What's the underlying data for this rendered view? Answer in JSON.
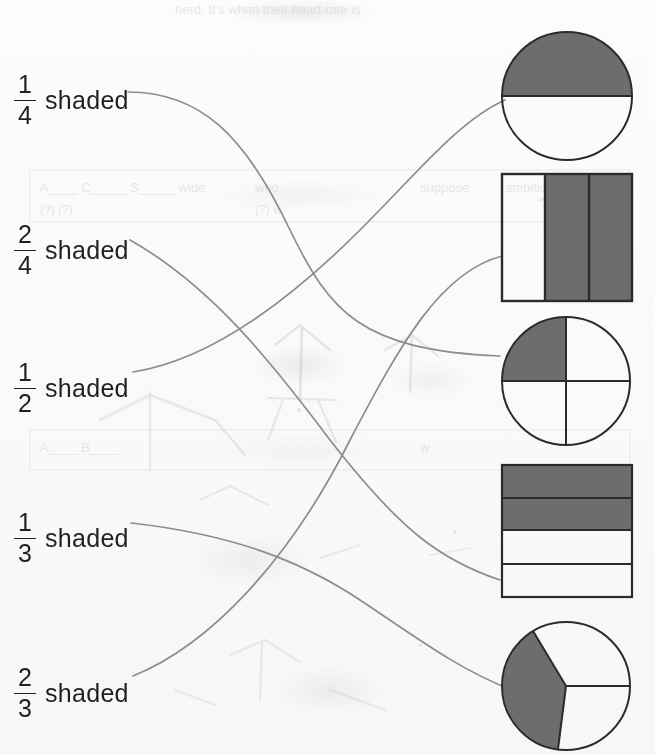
{
  "worksheet": {
    "type": "fraction-matching",
    "instruction_visible": false,
    "ink_color": "#8e8b92",
    "text_color": "#231f20",
    "shade_color": "#6d6d6d"
  },
  "labels": [
    {
      "id": "label-1-4",
      "numerator": "1",
      "denominator": "4",
      "word": "shaded",
      "x": 14,
      "y": 72
    },
    {
      "id": "label-2-4",
      "numerator": "2",
      "denominator": "4",
      "word": "shaded",
      "x": 14,
      "y": 222
    },
    {
      "id": "label-1-2",
      "numerator": "1",
      "denominator": "2",
      "word": "shaded",
      "x": 14,
      "y": 360
    },
    {
      "id": "label-1-3",
      "numerator": "1",
      "denominator": "3",
      "word": "shaded",
      "x": 14,
      "y": 510
    },
    {
      "id": "label-2-3",
      "numerator": "2",
      "denominator": "3",
      "word": "shaded",
      "x": 14,
      "y": 665
    }
  ],
  "figures": [
    {
      "id": "figure-circle-half",
      "shape": "circle",
      "parts": 2,
      "shaded": 1,
      "fraction": "1/2",
      "division": "horizontal",
      "x": 500,
      "y": 30,
      "w": 134,
      "h": 132
    },
    {
      "id": "figure-rect-thirds",
      "shape": "rectangle",
      "parts": 3,
      "shaded": 2,
      "fraction": "2/3",
      "division": "vertical-columns",
      "x": 500,
      "y": 172,
      "w": 134,
      "h": 131
    },
    {
      "id": "figure-circle-quarter",
      "shape": "circle",
      "parts": 4,
      "shaded": 1,
      "fraction": "1/4",
      "division": "quadrants",
      "x": 500,
      "y": 315,
      "w": 132,
      "h": 132
    },
    {
      "id": "figure-rect-quarters",
      "shape": "rectangle",
      "parts": 4,
      "shaded": 2,
      "fraction": "2/4",
      "division": "horizontal-rows",
      "x": 500,
      "y": 463,
      "w": 134,
      "h": 136
    },
    {
      "id": "figure-circle-thirds",
      "shape": "circle",
      "parts": 3,
      "shaded": 1,
      "fraction": "1/3",
      "division": "radial-thirds",
      "x": 500,
      "y": 620,
      "w": 133,
      "h": 133
    }
  ],
  "connections": [
    {
      "id": "connector-1-4",
      "from": "label-1-4",
      "to": "figure-circle-quarter"
    },
    {
      "id": "connector-2-4",
      "from": "label-2-4",
      "to": "figure-rect-quarters"
    },
    {
      "id": "connector-1-2",
      "from": "label-1-2",
      "to": "figure-circle-half"
    },
    {
      "id": "connector-1-3",
      "from": "label-1-3",
      "to": "figure-circle-thirds"
    },
    {
      "id": "connector-2-3",
      "from": "label-2-3",
      "to": "figure-rect-thirds"
    }
  ]
}
